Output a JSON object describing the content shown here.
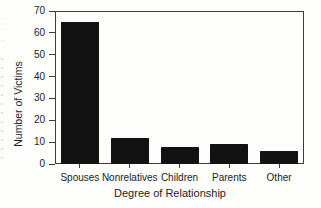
{
  "chart_data": {
    "type": "bar",
    "title": "",
    "categories": [
      "Spouses",
      "Nonrelatives",
      "Children",
      "Parents",
      "Other"
    ],
    "values": [
      65,
      12,
      8,
      9,
      6
    ],
    "xlabel": "Degree of Relationship",
    "ylabel": "Number of Victims",
    "ylim": [
      0,
      70
    ],
    "yticks": [
      0,
      10,
      20,
      30,
      40,
      50,
      60,
      70
    ],
    "grid": false,
    "legend": "none",
    "bar_color": "#121212",
    "axis_color": "#3d3d3d",
    "text_color": "#1c1c1c"
  }
}
